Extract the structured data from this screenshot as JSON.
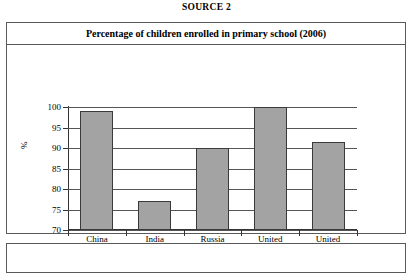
{
  "source_label": "SOURCE 2",
  "chart_data": {
    "type": "bar",
    "title": "Percentage of children enrolled in primary school (2006)",
    "xlabel": "",
    "ylabel": "%",
    "categories": [
      "China",
      "India",
      "Russia",
      "United Kingdom",
      "United States"
    ],
    "category_lines": [
      [
        "China"
      ],
      [
        "India"
      ],
      [
        "Russia"
      ],
      [
        "United",
        "Kingdom"
      ],
      [
        "United",
        "States"
      ]
    ],
    "values": [
      99,
      77,
      90,
      100,
      91.5
    ],
    "ylim": [
      70,
      100
    ],
    "yticks": [
      100,
      95,
      90,
      85,
      80,
      75,
      70
    ],
    "ytick_labels": [
      "100",
      "95",
      "90",
      "85",
      "80",
      "75",
      "70"
    ],
    "grid": true,
    "legend": false,
    "bar_color": "#a3a3a3",
    "bar_border_color": "#3a3a3a",
    "axis_color": "#333333",
    "grid_color": "#555555"
  }
}
